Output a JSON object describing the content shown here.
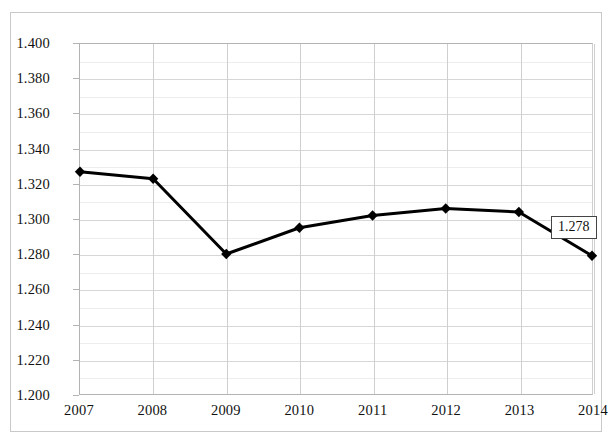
{
  "chart_data": {
    "type": "line",
    "title": "",
    "subtitle": "",
    "xlabel": "",
    "ylabel": "",
    "categories": [
      "2007",
      "2008",
      "2009",
      "2010",
      "2011",
      "2012",
      "2013",
      "2014"
    ],
    "series": [
      {
        "name": "series-1",
        "values": [
          1.327,
          1.323,
          1.28,
          1.295,
          1.302,
          1.306,
          1.304,
          1.279
        ],
        "color": "#000000",
        "marker": "diamond",
        "line_width": 3
      }
    ],
    "ylim": [
      1.2,
      1.4
    ],
    "ytick_step": 0.02,
    "yticks": [
      "1.400",
      "1.380",
      "1.360",
      "1.340",
      "1.320",
      "1.300",
      "1.280",
      "1.260",
      "1.240",
      "1.220",
      "1.200"
    ],
    "ytick_values": [
      1.4,
      1.38,
      1.36,
      1.34,
      1.32,
      1.3,
      1.28,
      1.26,
      1.24,
      1.22,
      1.2
    ],
    "minor_gridline_values": [
      1.39,
      1.37,
      1.35,
      1.33,
      1.31,
      1.29,
      1.27,
      1.25,
      1.23,
      1.21
    ],
    "xticks": [
      "2007",
      "2008",
      "2009",
      "2010",
      "2011",
      "2012",
      "2013",
      "2014"
    ],
    "grid": {
      "horizontal_major": true,
      "horizontal_minor": true,
      "vertical": true
    },
    "legend": {
      "visible": false,
      "position": "none",
      "entries": []
    },
    "annotations": [
      {
        "name": "last-point-data-label",
        "text": "1.278",
        "attached_to_category": "2014",
        "attached_to_value": 1.279,
        "boxed": true
      }
    ],
    "colors": {
      "series": "#000000",
      "plot_border": "#b3b3b3",
      "major_gridline": "#d6d6d6",
      "minor_gridline": "#ededed",
      "vertical_gridline": "#cfcfcf",
      "frame_border": "#c9c9c9",
      "background": "#ffffff",
      "text": "#111111"
    }
  }
}
